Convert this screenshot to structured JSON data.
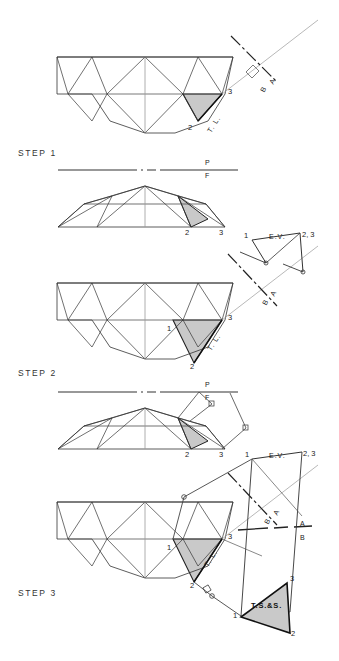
{
  "sheet": {
    "title": "Descriptive geometry construction: true size of a dome face in three steps",
    "background": "#ffffff",
    "ink": "#1a1a1a",
    "shade_fill": "#c9c9c9"
  },
  "steps": [
    {
      "id": "step1",
      "label": "STEP 1"
    },
    {
      "id": "step2",
      "label": "STEP 2"
    },
    {
      "id": "step3",
      "label": "STEP 3"
    }
  ],
  "annotations": {
    "true_length": "T. L.",
    "edge_view": "E.V.",
    "true_size": "T.S.&S.",
    "plane_p": "P",
    "plane_f": "F",
    "plane_a": "A",
    "plane_b": "B"
  },
  "vertex_labels": {
    "one": "1",
    "two": "2",
    "three": "3",
    "two_three": "2, 3"
  },
  "step1": {
    "label": "STEP 1",
    "top_view_points": {
      "three": "3",
      "two": "2"
    },
    "true_length_label": "T. L.",
    "fold_line": {
      "upper": "P",
      "lower": "F"
    },
    "front_view_points": {
      "two": "2",
      "three": "3"
    },
    "aux_fold": {
      "upper": "A",
      "lower": "B"
    }
  },
  "step2": {
    "label": "STEP 2",
    "top_view_points": {
      "one": "1",
      "two": "2",
      "three": "3"
    },
    "true_length_label": "T. L.",
    "fold_line": {
      "upper": "P",
      "lower": "F"
    },
    "front_view_points": {
      "two": "2",
      "three": "3"
    },
    "aux_fold": {
      "upper": "B",
      "lower": "A"
    },
    "aux_view": {
      "edge_view_label": "E.V.",
      "point_one": "1",
      "point_two_three": "2, 3"
    }
  },
  "step3": {
    "label": "STEP 3",
    "top_view_points": {
      "one": "1",
      "two": "2",
      "three": "3"
    },
    "true_length_label": "T. L.",
    "aux_fold_1": {
      "upper": "B",
      "lower": "A"
    },
    "aux_fold_2": {
      "upper": "A",
      "lower": "B"
    },
    "aux_view": {
      "edge_view_label": "E.V.",
      "point_one": "1",
      "point_two_three": "2, 3"
    },
    "true_size_view": {
      "label": "T.S.&S.",
      "point_one": "1",
      "point_two": "2",
      "point_three": "3"
    }
  }
}
